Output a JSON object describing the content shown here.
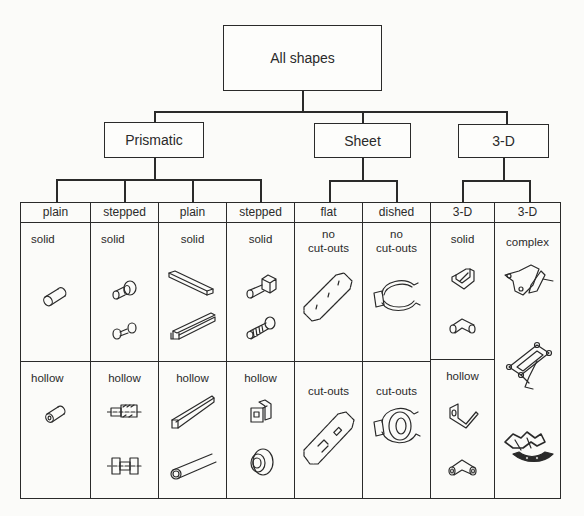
{
  "root": {
    "label": "All shapes"
  },
  "categories": [
    {
      "label": "Prismatic"
    },
    {
      "label": "Sheet"
    },
    {
      "label": "3-D"
    }
  ],
  "columns": [
    {
      "header": "plain",
      "parent": "Prismatic",
      "top": "solid",
      "bottom": "hollow",
      "top_icons": [
        "cylinder-icon"
      ],
      "bottom_icons": [
        "hollow-cylinder-icon"
      ]
    },
    {
      "header": "stepped",
      "parent": "Prismatic",
      "top": "solid",
      "bottom": "hollow",
      "top_icons": [
        "stepped-shaft-icon",
        "double-stepped-shaft-icon"
      ],
      "bottom_icons": [
        "stepped-bushing-section-icon",
        "spool-section-icon"
      ]
    },
    {
      "header": "plain",
      "parent": "Prismatic",
      "top": "solid",
      "bottom": "hollow",
      "top_icons": [
        "channel-bar-icon",
        "i-beam-icon"
      ],
      "bottom_icons": [
        "square-tube-icon",
        "round-tube-icon"
      ]
    },
    {
      "header": "stepped",
      "parent": "Prismatic",
      "top": "solid",
      "bottom": "hollow",
      "top_icons": [
        "t-head-bolt-icon",
        "threaded-bolt-icon"
      ],
      "bottom_icons": [
        "hollow-square-stepped-icon",
        "flanged-bushing-icon"
      ]
    },
    {
      "header": "flat",
      "parent": "Sheet",
      "top": "no cut-outs",
      "bottom": "cut-outs",
      "top_icons": [
        "flat-plate-icon"
      ],
      "bottom_icons": [
        "flat-plate-cutouts-icon"
      ]
    },
    {
      "header": "dished",
      "parent": "Sheet",
      "top": "no cut-outs",
      "bottom": "cut-outs",
      "top_icons": [
        "dished-clip-icon"
      ],
      "bottom_icons": [
        "dished-clip-cutout-icon"
      ]
    },
    {
      "header": "3-D",
      "parent": "3-D",
      "top": "solid",
      "bottom": "hollow",
      "top_icons": [
        "bracket-block-icon",
        "elbow-solid-icon"
      ],
      "bottom_icons": [
        "bent-bracket-icon",
        "elbow-hollow-icon"
      ]
    },
    {
      "header": "3-D",
      "parent": "3-D",
      "top": "complex",
      "bottom": null,
      "top_icons": [
        "linkage-arm-icon",
        "truss-frame-icon",
        "complex-assembly-icon"
      ],
      "bottom_icons": []
    }
  ],
  "labels": {
    "no_cutouts_line1": "no",
    "no_cutouts_line2": "cut-outs"
  }
}
